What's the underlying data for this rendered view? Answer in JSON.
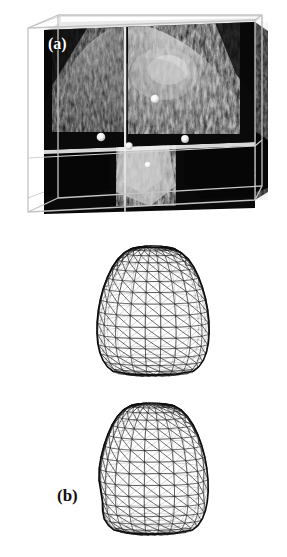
{
  "figure": {
    "background_color": "#ffffff",
    "width": 287,
    "height": 557,
    "panel_count": 3
  },
  "panels": [
    {
      "id": "a",
      "label": "(a)",
      "label_color": "#ffffff",
      "caption": "3D ultrasound volume rendered inside a wireframe bounding box with orthogonal cut planes and bright point-like fiducial markers",
      "type": "volume-rendering",
      "box_edge_color": "#b8b8b8",
      "slice_border_color": "#f2f2f2",
      "marker_color": "#ffffff",
      "marker_count": 5,
      "markers": [
        {
          "x": 101,
          "y": 137,
          "r": 4.2
        },
        {
          "x": 129,
          "y": 146,
          "r": 3.6
        },
        {
          "x": 155,
          "y": 99,
          "r": 4.2
        },
        {
          "x": 185,
          "y": 139,
          "r": 3.8
        },
        {
          "x": 148,
          "y": 164,
          "r": 3.4
        }
      ]
    },
    {
      "id": "b",
      "label": "(b)",
      "label_color": "#111111",
      "caption": "Smooth triangulated wireframe mesh of the segmented surface, rounded-triangular outline",
      "type": "wireframe-mesh",
      "mesh_color": "#111111",
      "mesh_rows": 17,
      "mesh_cols": 22,
      "surface_shape": "smooth",
      "center_x": 153,
      "center_y": 311,
      "radius_x": 65,
      "radius_y": 67
    },
    {
      "id": "c",
      "label": "(c)",
      "label_color": "#111111",
      "caption": "Irregular triangulated wireframe mesh of the segmented surface with bumpy, non-smoothed outline",
      "type": "wireframe-mesh",
      "mesh_color": "#111111",
      "mesh_rows": 17,
      "mesh_cols": 22,
      "surface_shape": "irregular",
      "center_x": 152,
      "center_y": 469,
      "radius_x": 64,
      "radius_y": 68
    }
  ],
  "chart_data": {
    "type": "scatter",
    "title": "",
    "xlabel": "",
    "ylabel": "",
    "legend": []
  }
}
